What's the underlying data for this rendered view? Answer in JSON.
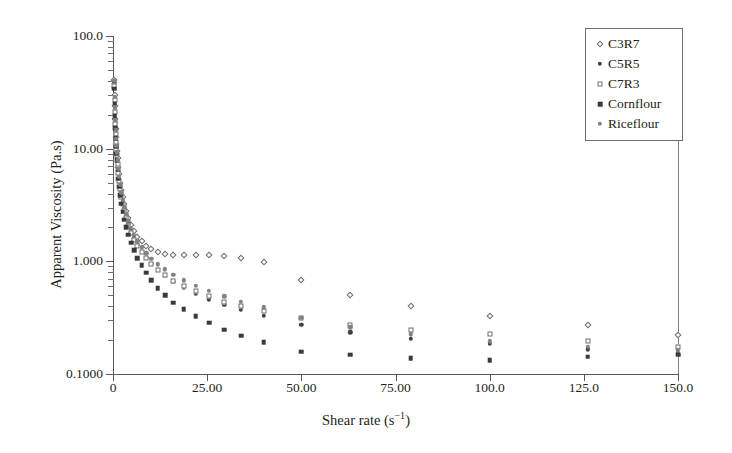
{
  "chart_data": {
    "type": "scatter",
    "title": "",
    "xlabel": "Shear rate (s−1)",
    "xlabel_base": "Shear rate (s",
    "xlabel_sup": "−1",
    "xlabel_close": ")",
    "ylabel": "Apparent Viscosity (Pa.s)",
    "yscale": "log",
    "xscale": "linear",
    "xlim": [
      0,
      150
    ],
    "ylim": [
      0.1,
      100
    ],
    "grid": false,
    "legend_position": "top-right",
    "xticklabels": [
      "0",
      "25.00",
      "50.00",
      "75.00",
      "100.0",
      "125.0",
      "150.0"
    ],
    "xtickvalues": [
      0,
      25,
      50,
      75,
      100,
      125,
      150
    ],
    "yticklabels": [
      "100.0",
      "10.00",
      "1.000",
      "0.1000"
    ],
    "ytickvalues": [
      100,
      10,
      1,
      0.1
    ],
    "series": [
      {
        "name": "C3R7",
        "marker": "open-diamond",
        "color": "#6d6e71",
        "points": [
          [
            0.3,
            41.0
          ],
          [
            0.4,
            30.0
          ],
          [
            0.5,
            24.0
          ],
          [
            0.6,
            18.5
          ],
          [
            0.7,
            15.0
          ],
          [
            0.8,
            12.6
          ],
          [
            0.9,
            11.0
          ],
          [
            1.0,
            9.6
          ],
          [
            1.2,
            8.2
          ],
          [
            1.4,
            6.9
          ],
          [
            1.6,
            5.9
          ],
          [
            1.9,
            5.0
          ],
          [
            2.2,
            4.3
          ],
          [
            2.6,
            3.7
          ],
          [
            3.0,
            3.2
          ],
          [
            3.5,
            2.8
          ],
          [
            4.1,
            2.4
          ],
          [
            4.8,
            2.1
          ],
          [
            5.6,
            1.85
          ],
          [
            6.5,
            1.65
          ],
          [
            7.6,
            1.5
          ],
          [
            8.8,
            1.38
          ],
          [
            10.2,
            1.28
          ],
          [
            11.9,
            1.2
          ],
          [
            13.8,
            1.16
          ],
          [
            16.0,
            1.14
          ],
          [
            18.8,
            1.14
          ],
          [
            22.0,
            1.13
          ],
          [
            25.5,
            1.13
          ],
          [
            29.5,
            1.11
          ],
          [
            34.0,
            1.07
          ],
          [
            40.0,
            0.98
          ],
          [
            50.0,
            0.68
          ],
          [
            63.0,
            0.5
          ],
          [
            79.0,
            0.4
          ],
          [
            100.0,
            0.33
          ],
          [
            126.0,
            0.27
          ],
          [
            150.0,
            0.22
          ]
        ]
      },
      {
        "name": "C5R5",
        "marker": "filled-circle",
        "color": "#414042",
        "points": [
          [
            0.3,
            38.0
          ],
          [
            0.4,
            28.0
          ],
          [
            0.5,
            22.0
          ],
          [
            0.6,
            17.0
          ],
          [
            0.7,
            14.0
          ],
          [
            0.8,
            11.8
          ],
          [
            0.9,
            10.2
          ],
          [
            1.0,
            9.0
          ],
          [
            1.2,
            7.6
          ],
          [
            1.4,
            6.4
          ],
          [
            1.6,
            5.4
          ],
          [
            1.9,
            4.6
          ],
          [
            2.2,
            3.9
          ],
          [
            2.6,
            3.35
          ],
          [
            3.0,
            2.9
          ],
          [
            3.5,
            2.5
          ],
          [
            4.1,
            2.15
          ],
          [
            4.8,
            1.85
          ],
          [
            5.6,
            1.6
          ],
          [
            6.5,
            1.4
          ],
          [
            7.6,
            1.22
          ],
          [
            8.8,
            1.08
          ],
          [
            10.2,
            0.95
          ],
          [
            11.9,
            0.84
          ],
          [
            13.8,
            0.74
          ],
          [
            16.0,
            0.66
          ],
          [
            18.8,
            0.58
          ],
          [
            22.0,
            0.52
          ],
          [
            25.5,
            0.46
          ],
          [
            29.5,
            0.41
          ],
          [
            34.0,
            0.37
          ],
          [
            40.0,
            0.33
          ],
          [
            50.0,
            0.275
          ],
          [
            63.0,
            0.235
          ],
          [
            79.0,
            0.205
          ],
          [
            100.0,
            0.185
          ],
          [
            126.0,
            0.165
          ],
          [
            150.0,
            0.155
          ]
        ]
      },
      {
        "name": "C7R3",
        "marker": "open-square",
        "color": "#6d6e71",
        "points": [
          [
            0.3,
            36.0
          ],
          [
            0.4,
            27.0
          ],
          [
            0.5,
            21.0
          ],
          [
            0.6,
            16.5
          ],
          [
            0.7,
            13.5
          ],
          [
            0.8,
            11.4
          ],
          [
            0.9,
            9.9
          ],
          [
            1.0,
            8.7
          ],
          [
            1.2,
            7.3
          ],
          [
            1.4,
            6.1
          ],
          [
            1.6,
            5.2
          ],
          [
            1.9,
            4.4
          ],
          [
            2.2,
            3.75
          ],
          [
            2.6,
            3.2
          ],
          [
            3.0,
            2.78
          ],
          [
            3.5,
            2.4
          ],
          [
            4.1,
            2.06
          ],
          [
            4.8,
            1.78
          ],
          [
            5.6,
            1.55
          ],
          [
            6.5,
            1.36
          ],
          [
            7.6,
            1.2
          ],
          [
            8.8,
            1.06
          ],
          [
            10.2,
            0.94
          ],
          [
            11.9,
            0.84
          ],
          [
            13.8,
            0.75
          ],
          [
            16.0,
            0.67
          ],
          [
            18.8,
            0.6
          ],
          [
            22.0,
            0.54
          ],
          [
            25.5,
            0.49
          ],
          [
            29.5,
            0.44
          ],
          [
            34.0,
            0.4
          ],
          [
            40.0,
            0.36
          ],
          [
            50.0,
            0.315
          ],
          [
            63.0,
            0.275
          ],
          [
            79.0,
            0.245
          ],
          [
            100.0,
            0.225
          ],
          [
            126.0,
            0.195
          ],
          [
            150.0,
            0.175
          ]
        ]
      },
      {
        "name": "Cornflour",
        "marker": "filled-square",
        "color": "#3a3a3c",
        "points": [
          [
            0.3,
            34.0
          ],
          [
            0.4,
            25.0
          ],
          [
            0.5,
            19.5
          ],
          [
            0.6,
            15.2
          ],
          [
            0.7,
            12.4
          ],
          [
            0.8,
            10.4
          ],
          [
            0.9,
            9.0
          ],
          [
            1.0,
            7.9
          ],
          [
            1.2,
            6.5
          ],
          [
            1.4,
            5.4
          ],
          [
            1.6,
            4.6
          ],
          [
            1.9,
            3.85
          ],
          [
            2.2,
            3.25
          ],
          [
            2.6,
            2.75
          ],
          [
            3.0,
            2.35
          ],
          [
            3.5,
            2.0
          ],
          [
            4.1,
            1.72
          ],
          [
            4.8,
            1.46
          ],
          [
            5.6,
            1.25
          ],
          [
            6.5,
            1.07
          ],
          [
            7.6,
            0.92
          ],
          [
            8.8,
            0.79
          ],
          [
            10.2,
            0.68
          ],
          [
            11.9,
            0.58
          ],
          [
            13.8,
            0.5
          ],
          [
            16.0,
            0.43
          ],
          [
            18.8,
            0.375
          ],
          [
            22.0,
            0.325
          ],
          [
            25.5,
            0.285
          ],
          [
            29.5,
            0.248
          ],
          [
            34.0,
            0.218
          ],
          [
            40.0,
            0.192
          ],
          [
            50.0,
            0.158
          ],
          [
            63.0,
            0.148
          ],
          [
            79.0,
            0.138
          ],
          [
            100.0,
            0.133
          ],
          [
            126.0,
            0.142
          ],
          [
            150.0,
            0.148
          ]
        ]
      },
      {
        "name": "Riceflour",
        "marker": "grey-circle",
        "color": "#808285",
        "points": [
          [
            0.3,
            40.0
          ],
          [
            0.4,
            29.0
          ],
          [
            0.5,
            23.0
          ],
          [
            0.6,
            18.0
          ],
          [
            0.7,
            14.6
          ],
          [
            0.8,
            12.2
          ],
          [
            0.9,
            10.6
          ],
          [
            1.0,
            9.3
          ],
          [
            1.2,
            7.9
          ],
          [
            1.4,
            6.6
          ],
          [
            1.6,
            5.6
          ],
          [
            1.9,
            4.8
          ],
          [
            2.2,
            4.1
          ],
          [
            2.6,
            3.5
          ],
          [
            3.0,
            3.05
          ],
          [
            3.5,
            2.65
          ],
          [
            4.1,
            2.28
          ],
          [
            4.8,
            1.98
          ],
          [
            5.6,
            1.72
          ],
          [
            6.5,
            1.5
          ],
          [
            7.6,
            1.33
          ],
          [
            8.8,
            1.18
          ],
          [
            10.2,
            1.05
          ],
          [
            11.9,
            0.94
          ],
          [
            13.8,
            0.85
          ],
          [
            16.0,
            0.76
          ],
          [
            18.8,
            0.68
          ],
          [
            22.0,
            0.61
          ],
          [
            25.5,
            0.55
          ],
          [
            29.5,
            0.49
          ],
          [
            34.0,
            0.44
          ],
          [
            40.0,
            0.39
          ],
          [
            50.0,
            0.315
          ],
          [
            63.0,
            0.26
          ],
          [
            79.0,
            0.225
          ],
          [
            100.0,
            0.195
          ],
          [
            126.0,
            0.175
          ],
          [
            150.0,
            0.162
          ]
        ]
      }
    ]
  },
  "legend": {
    "items": [
      {
        "label": "C3R7",
        "marker": "open-diamond"
      },
      {
        "label": "C5R5",
        "marker": "filled-circle"
      },
      {
        "label": "C7R3",
        "marker": "open-square"
      },
      {
        "label": "Cornflour",
        "marker": "filled-square"
      },
      {
        "label": "Riceflour",
        "marker": "grey-circle"
      }
    ]
  },
  "colors": {
    "axis": "#58595b",
    "text": "#231f20",
    "background": "#ffffff",
    "frame_right": "#808285"
  }
}
